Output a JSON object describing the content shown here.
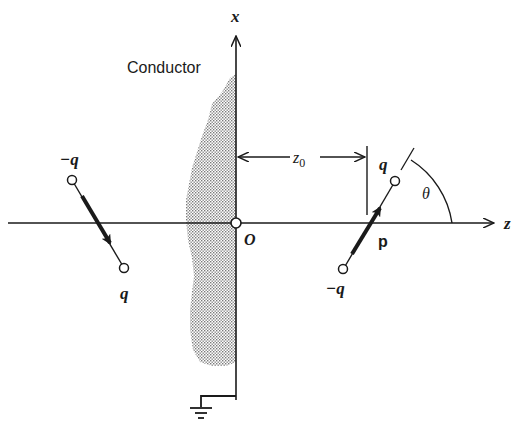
{
  "figure": {
    "conductor_label": "Conductor",
    "axes": {
      "x_label": "x",
      "z_label": "z",
      "origin_label": "O"
    },
    "distance_label": "z",
    "distance_subscript": "0",
    "angle_label": "θ",
    "dipole_moment_label": "p",
    "real_dipole": {
      "positive_charge_label": "q",
      "negative_charge_label": "−q"
    },
    "image_dipole": {
      "positive_charge_label": "q",
      "negative_charge_label": "−q"
    },
    "colors": {
      "line": "#1a1a1a",
      "conductor_fill": "#9a9a9a",
      "background": "#ffffff"
    }
  }
}
